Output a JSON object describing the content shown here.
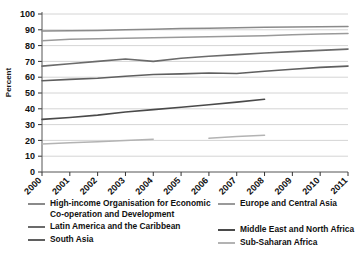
{
  "chart_data": {
    "type": "line",
    "title": "",
    "subtitle": "",
    "xlabel": "",
    "ylabel": "Percent",
    "x": [
      2000,
      2001,
      2002,
      2003,
      2004,
      2005,
      2006,
      2007,
      2008,
      2009,
      2010,
      2011
    ],
    "xticklabels": [
      "2000",
      "2001",
      "2002",
      "2003",
      "2004",
      "2005",
      "2006",
      "2007",
      "2008",
      "2009",
      "2010",
      "2011"
    ],
    "yticklabels": [
      "0",
      "10",
      "20",
      "30",
      "40",
      "50",
      "60",
      "70",
      "80",
      "90",
      "100"
    ],
    "ylim": [
      0,
      100
    ],
    "ytick_step": 10,
    "xlim": [
      2000,
      2011
    ],
    "grid": "horizontal",
    "legend_position": "bottom",
    "legend_columns": 2,
    "series": [
      {
        "name": "High-income Organisation for Economic Co-operation and Development",
        "legend_label": "High-income Organisation for Economic\nCo-operation and Development",
        "color": "#8a8a8a",
        "width": 1.5,
        "values": [
          89.2,
          89.4,
          89.6,
          90.0,
          90.4,
          90.8,
          91.0,
          91.3,
          91.6,
          91.8,
          92.0,
          92.1
        ]
      },
      {
        "name": "Europe and Central Asia",
        "legend_label": "Europe and Central Asia",
        "color": "#9a9a9a",
        "width": 1.5,
        "values": [
          83.0,
          84.0,
          84.3,
          84.6,
          85.0,
          85.3,
          85.6,
          85.9,
          86.3,
          86.8,
          87.3,
          87.6
        ]
      },
      {
        "name": "Latin America and the Caribbean",
        "legend_label": "Latin America and the Caribbean",
        "color": "#6b6b6b",
        "width": 1.6,
        "values": [
          67.0,
          68.5,
          70.0,
          71.5,
          70.0,
          72.0,
          73.3,
          74.3,
          75.3,
          76.2,
          77.0,
          77.8
        ]
      },
      {
        "name": "Middle East and North Africa",
        "legend_label": "Middle East and North Africa",
        "color": "#4a4a4a",
        "width": 1.6,
        "values": [
          33.3,
          34.5,
          36.0,
          38.0,
          39.5,
          41.0,
          42.6,
          44.2,
          46.0,
          null,
          null,
          null
        ]
      },
      {
        "name": "South Asia",
        "legend_label": "South Asia",
        "color": "#5f5f5f",
        "width": 1.6,
        "values": [
          57.8,
          58.6,
          59.3,
          60.6,
          61.7,
          62.1,
          62.7,
          62.3,
          63.8,
          65.0,
          66.2,
          67.0
        ]
      },
      {
        "name": "Sub-Saharan Africa",
        "legend_label": "Sub-Saharan Africa",
        "color": "#b3b3b3",
        "width": 1.5,
        "values": [
          17.8,
          18.5,
          19.2,
          20.0,
          20.8,
          null,
          21.4,
          22.4,
          23.3,
          null,
          null,
          null
        ]
      }
    ]
  },
  "axes": {
    "ylabel": "Percent"
  },
  "legend": {
    "columns": [
      {
        "entries": [
          {
            "label": "High-income Organisation for Economic\nCo-operation and Development",
            "color": "#8a8a8a"
          },
          {
            "label": "Latin America and the Caribbean",
            "color": "#6b6b6b"
          },
          {
            "label": "South Asia",
            "color": "#5f5f5f"
          }
        ]
      },
      {
        "entries": [
          {
            "label": "Europe and Central Asia",
            "color": "#9a9a9a"
          },
          {
            "label": "Middle East and North Africa",
            "color": "#4a4a4a"
          },
          {
            "label": "Sub-Saharan Africa",
            "color": "#b3b3b3"
          }
        ]
      }
    ]
  }
}
